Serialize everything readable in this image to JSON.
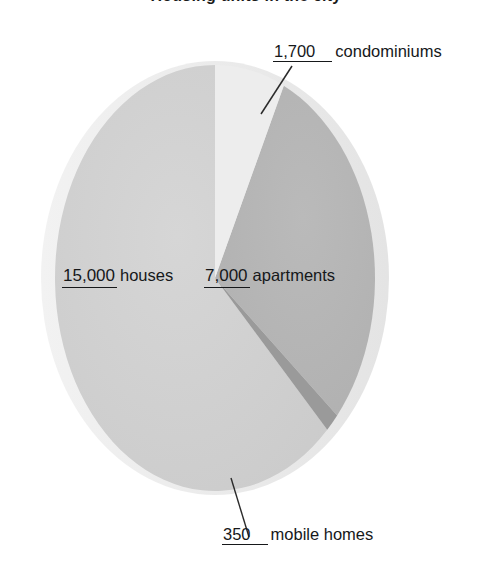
{
  "title": "Housing units in the city",
  "chart_data": {
    "type": "pie",
    "title": "Housing units in the city",
    "labels": [
      "houses",
      "apartments",
      "condominiums",
      "mobile homes"
    ],
    "values": [
      15000,
      7000,
      1700,
      350
    ],
    "value_labels": [
      "15,000",
      "7,000",
      "1,700",
      "350"
    ],
    "total": 24050,
    "percentages": [
      62.4,
      29.1,
      7.1,
      1.5
    ],
    "colors": [
      "#d0d0d0",
      "#b4b4b4",
      "#ededed",
      "#9a9a9a"
    ],
    "legend": "none",
    "style": "3d-ellipse",
    "leader_lines": [
      "condominiums",
      "mobile homes"
    ],
    "slices": [
      {
        "name": "houses",
        "value": 15000,
        "value_label": "15,000",
        "percent": 62.4,
        "color": "#d0d0d0"
      },
      {
        "name": "apartments",
        "value": 7000,
        "value_label": "7,000",
        "percent": 29.1,
        "color": "#b4b4b4"
      },
      {
        "name": "condominiums",
        "value": 1700,
        "value_label": "1,700",
        "percent": 7.1,
        "color": "#ededed"
      },
      {
        "name": "mobile homes",
        "value": 350,
        "value_label": "350",
        "percent": 1.5,
        "color": "#9a9a9a"
      }
    ]
  },
  "labels": {
    "condominiums": {
      "value": "1,700",
      "name": "condominiums"
    },
    "houses": {
      "value": "15,000",
      "name": "houses"
    },
    "apartments": {
      "value": "7,000",
      "name": "apartments"
    },
    "mobile_homes": {
      "value": "350",
      "name": "mobile homes"
    }
  },
  "colors": {
    "houses": "#d0d0d0",
    "apartments": "#b4b4b4",
    "condominiums": "#ededed",
    "mobile_homes": "#9a9a9a",
    "rim": "#e6e6e6",
    "text": "#16181a",
    "background": "#ffffff",
    "leader": "#2b2b2b"
  }
}
